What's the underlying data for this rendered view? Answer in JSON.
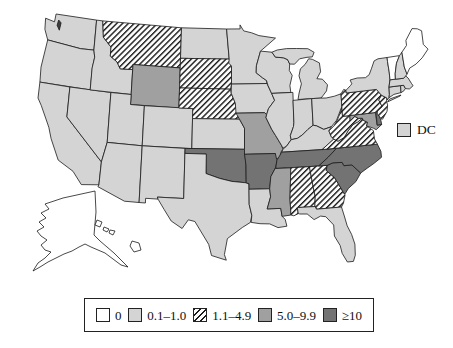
{
  "figure": {
    "type": "us-choropleth-map",
    "region": "United States (50 states + DC, Alaska and Hawaii inset)"
  },
  "legend": {
    "items": [
      {
        "key": "zero",
        "label": "0",
        "fill": "#ffffff",
        "pattern": "solid"
      },
      {
        "key": "low",
        "label": "0.1–1.0",
        "fill": "#d4d4d4",
        "pattern": "solid"
      },
      {
        "key": "mid",
        "label": "1.1–4.9",
        "fill": "#fcfcfc",
        "pattern": "hatch",
        "hatch_color": "#1a1a1a"
      },
      {
        "key": "high",
        "label": "5.0–9.9",
        "fill": "#a0a0a0",
        "pattern": "solid"
      },
      {
        "key": "highest",
        "label": "≥10",
        "fill": "#737373",
        "pattern": "solid"
      }
    ],
    "dc": {
      "label": "DC",
      "key": "low"
    }
  },
  "chart_data": {
    "type": "choropleth",
    "categories": [
      "0",
      "0.1–1.0",
      "1.1–4.9",
      "5.0–9.9",
      "≥10"
    ],
    "category_keys": [
      "zero",
      "low",
      "mid",
      "high",
      "highest"
    ],
    "outline_color": "#1b1b1b",
    "water_mark_color": "#3f3f3f",
    "states": {
      "AK": "zero",
      "AL": "mid",
      "AR": "highest",
      "AZ": "low",
      "CA": "low",
      "CO": "low",
      "CT": "low",
      "DC": "low",
      "DE": "highest",
      "FL": "low",
      "GA": "mid",
      "HI": "zero",
      "IA": "low",
      "ID": "low",
      "IL": "low",
      "IN": "low",
      "KS": "low",
      "KY": "low",
      "LA": "low",
      "MA": "low",
      "MD": "high",
      "ME": "zero",
      "MI": "low",
      "MN": "low",
      "MO": "high",
      "MS": "high",
      "MT": "mid",
      "NC": "highest",
      "ND": "low",
      "NE": "mid",
      "NH": "low",
      "NJ": "mid",
      "NM": "low",
      "NV": "low",
      "NY": "low",
      "OH": "low",
      "OK": "highest",
      "OR": "low",
      "PA": "mid",
      "RI": "low",
      "SC": "highest",
      "SD": "mid",
      "TN": "highest",
      "TX": "low",
      "UT": "low",
      "VA": "mid",
      "VT": "zero",
      "WA": "low",
      "WI": "low",
      "WV": "mid",
      "WY": "high"
    }
  }
}
